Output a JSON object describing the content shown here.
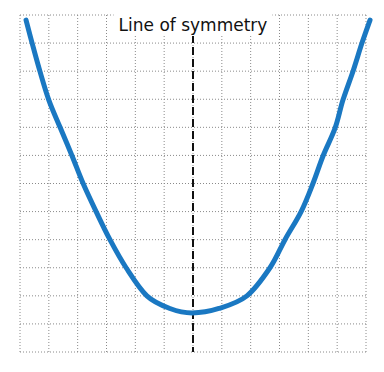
{
  "chart_data": {
    "type": "line",
    "title": "",
    "xlabel": "",
    "ylabel": "",
    "grid": true,
    "xlim": [
      0,
      12
    ],
    "ylim": [
      0,
      12
    ],
    "grid_step": 1,
    "annotation": "Line of symmetry",
    "axis_of_symmetry_x": 6,
    "series": [
      {
        "name": "parabola",
        "color": "#1a78c2",
        "x": [
          0.21,
          0.42,
          0.69,
          1.0,
          1.39,
          1.8,
          2.19,
          2.64,
          3.12,
          3.68,
          4.4,
          5.2,
          5.97,
          6.9,
          7.87,
          8.67,
          9.19,
          9.75,
          10.16,
          10.51,
          10.93,
          11.2,
          11.55,
          11.86,
          12.14
        ],
        "y": [
          11.82,
          11.0,
          10.0,
          8.97,
          8.0,
          7.0,
          6.0,
          5.0,
          4.0,
          3.0,
          2.0,
          1.55,
          1.39,
          1.55,
          2.0,
          3.0,
          4.0,
          5.0,
          6.0,
          6.98,
          7.98,
          8.97,
          10.0,
          11.0,
          11.82
        ]
      }
    ]
  },
  "colors": {
    "curve": "#1a78c2",
    "symmetry_line": "#111111",
    "grid": "#8a8a8a"
  }
}
